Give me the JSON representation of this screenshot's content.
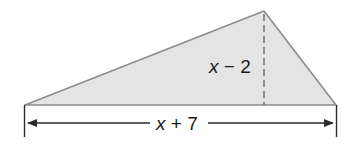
{
  "diagram": {
    "type": "triangle",
    "height_label": {
      "var": "x",
      "rest": " − 2"
    },
    "base_label": {
      "var": "x",
      "rest": " + 7"
    },
    "colors": {
      "fill": "#e4e4e4",
      "stroke": "#8c8c8c",
      "dimension": "#2a2a2a",
      "text": "#1a1a1a"
    }
  }
}
